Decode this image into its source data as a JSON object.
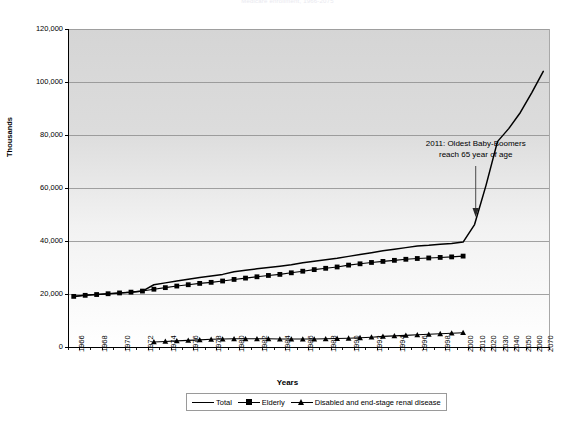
{
  "chart": {
    "title": "Medicare enrollment, 1966-2075",
    "xlabel": "Years",
    "ylabel": "Thousands",
    "annotation_line1": "2011: Oldest Baby-Boomers",
    "annotation_line2": "reach 65 year of age"
  },
  "legend": {
    "items": [
      {
        "label": "Total",
        "marker": "line"
      },
      {
        "label": "Elderly",
        "marker": "square"
      },
      {
        "label": "Disabled and end-stage renal disease",
        "marker": "triangle"
      }
    ]
  },
  "colors": {
    "series": "#000000",
    "gridline": "#8c8c8c",
    "axis": "#000000",
    "plot_bg_top": "#d5d5d5",
    "plot_bg_bottom": "#ffffff",
    "legend_border": "#9a9a9a"
  },
  "chart_data": {
    "type": "line",
    "title": "Medicare enrollment, 1966-2075",
    "xlabel": "Years",
    "ylabel": "Thousands",
    "ylim": [
      0,
      120000
    ],
    "yticks": [
      0,
      20000,
      40000,
      60000,
      80000,
      100000,
      120000
    ],
    "ytick_labels": [
      "0",
      "20,000",
      "40,000",
      "60,000",
      "80,000",
      "100,000",
      "120,000"
    ],
    "grid": true,
    "legend_position": "bottom",
    "x_axis_type": "category",
    "categories": [
      1966,
      1967,
      1968,
      1969,
      1970,
      1971,
      1972,
      1973,
      1974,
      1975,
      1976,
      1977,
      1978,
      1979,
      1980,
      1981,
      1982,
      1983,
      1984,
      1985,
      1986,
      1987,
      1988,
      1989,
      1990,
      1991,
      1992,
      1993,
      1994,
      1995,
      1996,
      1997,
      1998,
      1999,
      2000,
      2010,
      2020,
      2030,
      2040,
      2050,
      2060,
      2070
    ],
    "xtick_labels": [
      "1966",
      "1968",
      "1970",
      "1972",
      "1974",
      "1976",
      "1978",
      "1980",
      "1982",
      "1984",
      "1986",
      "1988",
      "1990",
      "1992",
      "1994",
      "1996",
      "1998",
      "2000",
      "2010",
      "2020",
      "2030",
      "2040",
      "2050",
      "2060",
      "2070"
    ],
    "xtick_step": 2,
    "series": [
      {
        "name": "Total",
        "marker": "none",
        "x": [
          1966,
          1967,
          1968,
          1969,
          1970,
          1971,
          1972,
          1973,
          1974,
          1975,
          1976,
          1977,
          1978,
          1979,
          1980,
          1981,
          1982,
          1983,
          1984,
          1985,
          1986,
          1987,
          1988,
          1989,
          1990,
          1991,
          1992,
          1993,
          1994,
          1995,
          1996,
          1997,
          1998,
          1999,
          2000,
          2010,
          2020,
          2030,
          2040,
          2050,
          2060,
          2070
        ],
        "values": [
          19100,
          19500,
          19800,
          20100,
          20400,
          20700,
          21100,
          23500,
          24200,
          24900,
          25600,
          26200,
          26800,
          27400,
          28400,
          29000,
          29500,
          30000,
          30500,
          31000,
          31800,
          32400,
          32900,
          33500,
          34200,
          34900,
          35600,
          36300,
          36900,
          37500,
          38100,
          38400,
          38800,
          39100,
          39600,
          46200,
          61000,
          77500,
          82500,
          88500,
          96000,
          104000
        ]
      },
      {
        "name": "Elderly",
        "marker": "square",
        "x": [
          1966,
          1967,
          1968,
          1969,
          1970,
          1971,
          1972,
          1973,
          1974,
          1975,
          1976,
          1977,
          1978,
          1979,
          1980,
          1981,
          1982,
          1983,
          1984,
          1985,
          1986,
          1987,
          1988,
          1989,
          1990,
          1991,
          1992,
          1993,
          1994,
          1995,
          1996,
          1997,
          1998,
          1999,
          2000
        ],
        "values": [
          19100,
          19500,
          19800,
          20100,
          20400,
          20700,
          21100,
          21800,
          22400,
          23000,
          23500,
          24000,
          24400,
          24900,
          25500,
          26000,
          26500,
          27000,
          27400,
          28000,
          28600,
          29200,
          29700,
          30200,
          30900,
          31400,
          31900,
          32300,
          32700,
          33100,
          33400,
          33600,
          33800,
          34000,
          34300
        ]
      },
      {
        "name": "Disabled and end-stage renal disease",
        "marker": "triangle",
        "x": [
          1973,
          1974,
          1975,
          1976,
          1977,
          1978,
          1979,
          1980,
          1981,
          1982,
          1983,
          1984,
          1985,
          1986,
          1987,
          1988,
          1989,
          1990,
          1991,
          1992,
          1993,
          1994,
          1995,
          1996,
          1997,
          1998,
          1999,
          2000
        ],
        "values": [
          1900,
          2100,
          2300,
          2500,
          2700,
          2900,
          3000,
          3100,
          3100,
          3100,
          3100,
          3000,
          3000,
          3000,
          3000,
          3100,
          3200,
          3300,
          3500,
          3700,
          4000,
          4200,
          4400,
          4600,
          4800,
          5000,
          5200,
          5400
        ]
      }
    ],
    "annotations": [
      {
        "text": "2011: Oldest Baby-Boomers reach 65 year of age",
        "arrow_to_x": 2011,
        "arrow_to_y": 42000
      }
    ]
  }
}
